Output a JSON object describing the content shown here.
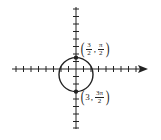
{
  "diagram": {
    "type": "polar-circle-graph",
    "colors": {
      "axis": "#222222",
      "curve": "#222222",
      "point": "#222222",
      "background": "#ffffff"
    },
    "axes": {
      "origin_px": [
        76,
        69
      ],
      "unit_px": 7.5,
      "x_range_px": [
        12,
        148
      ],
      "y_range_px": [
        7,
        128
      ],
      "arrow": "positive-x"
    },
    "circle": {
      "center_units": [
        0,
        -0.75
      ],
      "radius_units": 2.25
    },
    "points": [
      {
        "label": {
          "r_num": "3",
          "r_den": "2",
          "theta_num": "π",
          "theta_den": "2"
        },
        "position_units": [
          0,
          1.5
        ]
      },
      {
        "label": {
          "r": "3",
          "theta_num": "3π",
          "theta_den": "2"
        },
        "position_units": [
          0,
          -3
        ]
      }
    ]
  }
}
